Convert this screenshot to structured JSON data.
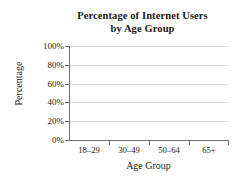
{
  "chart_data": {
    "type": "bar",
    "title": "Percentage of Internet Users by Age Group",
    "title_lines": [
      "Percentage of Internet Users",
      "by Age Group"
    ],
    "xlabel": "Age Group",
    "ylabel": "Percentage",
    "categories": [
      "18–29",
      "30–49",
      "50–64",
      "65+"
    ],
    "values": [
      null,
      null,
      null,
      null
    ],
    "series": [
      {
        "name": "Percentage of Internet Users",
        "values": [
          null,
          null,
          null,
          null
        ]
      }
    ],
    "ylim": [
      0,
      100
    ],
    "ytick_values": [
      0,
      20,
      40,
      60,
      80,
      100
    ],
    "ytick_labels": [
      "0%",
      "20%",
      "40%",
      "60%",
      "80%",
      "100%"
    ],
    "grid": true,
    "grid_axis": "y",
    "legend": false,
    "legend_position": "none",
    "note": "Blank axes template — no bars plotted",
    "colors": {
      "background": "#ffffff",
      "axis": "#6e6e6e",
      "gridline": "#d9d9d9",
      "text": "#1a1a1a"
    }
  }
}
